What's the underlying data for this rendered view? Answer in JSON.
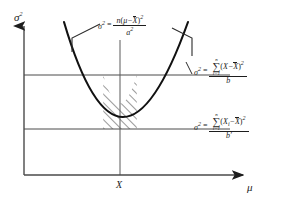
{
  "figure": {
    "type": "diagram",
    "background_color": "#ffffff",
    "line_color": "#1d1d1d",
    "curve_color": "#111111"
  },
  "axes": {
    "y_label": "σ",
    "y_label_exponent": "2",
    "x_label": "μ",
    "x_tick_label": "X",
    "y_axis_x": 24,
    "x_axis_y": 175,
    "x_axis_end": 245,
    "y_axis_top": 22
  },
  "curve": {
    "vertex_x": 120,
    "vertex_y": 175,
    "left_top_x": 64,
    "right_top_x": 188,
    "top_y": 22
  },
  "reference_lines": [
    {
      "name": "upper",
      "y": 75,
      "x_start": 24,
      "x_end": 230
    },
    {
      "name": "lower",
      "y": 129,
      "x_start": 24,
      "x_end": 230
    }
  ],
  "hatched_region": {
    "top_y": 75,
    "bottom_y": 129,
    "hatch_angle": "45deg",
    "hatch_spacing_px": 6
  },
  "equations": {
    "top": {
      "lhs": "σ",
      "lhs_exponent": "2",
      "equals": "=",
      "numerator_prefix": "n",
      "numerator_open": "(",
      "numerator_mu": "μ",
      "numerator_minus": "−",
      "numerator_xbar": "X",
      "numerator_close": ")",
      "numerator_exponent": "2",
      "denominator": "a",
      "denominator_exponent": "2"
    },
    "right_upper": {
      "lhs": "σ",
      "lhs_exponent": "2",
      "equals": "=",
      "sum_upper_limit": "n",
      "sum_glyph": "∑",
      "sum_lower_limit": "i=1",
      "numerator_open": "(",
      "numerator_x": "X",
      "numerator_minus": "−",
      "numerator_xbar": "X",
      "numerator_close": ")",
      "numerator_exponent": "2",
      "denominator": "b"
    },
    "right_lower": {
      "lhs": "σ",
      "lhs_exponent": "2",
      "equals": "=",
      "sum_upper_limit": "n",
      "sum_glyph": "∑",
      "sum_lower_limit": "i=1",
      "numerator_open": "(",
      "numerator_x": "X",
      "numerator_x_subscript": "i",
      "numerator_minus": "−",
      "numerator_xbar": "X",
      "numerator_close": ")",
      "numerator_exponent": "2",
      "denominator": "b′"
    }
  },
  "leader_lines": [
    {
      "name": "left-callout",
      "from_x": 100,
      "from_y": 24,
      "to_x": 72,
      "to_y": 36
    },
    {
      "name": "right-callout",
      "from_x": 172,
      "from_y": 27,
      "to_x": 196,
      "to_y": 38
    }
  ]
}
